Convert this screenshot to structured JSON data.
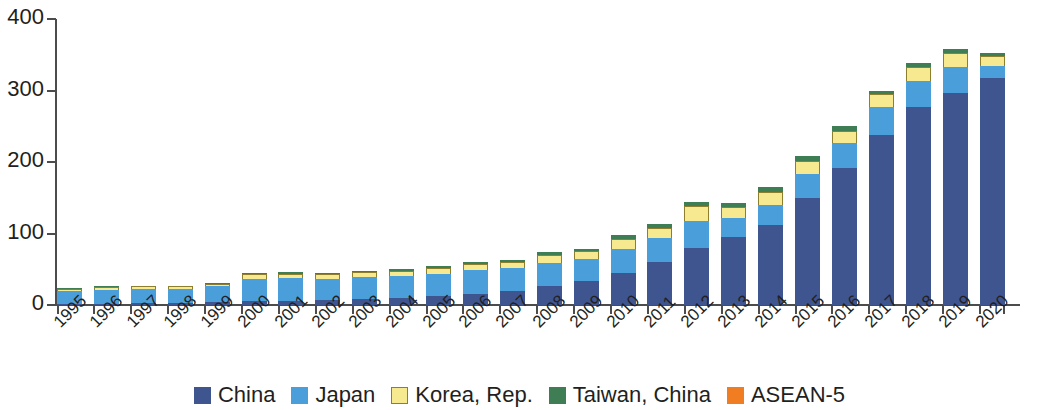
{
  "chart_data": {
    "type": "bar",
    "stacked": true,
    "title": "",
    "subtitle": "",
    "xlabel": "",
    "ylabel": "",
    "ylim": [
      0,
      400
    ],
    "yticks": [
      0,
      100,
      200,
      300,
      400
    ],
    "grid": false,
    "legend_position": "bottom",
    "categories": [
      "1995",
      "1996",
      "1997",
      "1998",
      "1999",
      "2000",
      "2001",
      "2002",
      "2003",
      "2004",
      "2005",
      "2006",
      "2007",
      "2008",
      "2009",
      "2010",
      "2011",
      "2012",
      "2013",
      "2014",
      "2015",
      "2016",
      "2017",
      "2018",
      "2019",
      "2020"
    ],
    "series": [
      {
        "name": "China",
        "color": "#3e5590",
        "values": [
          2,
          2,
          3,
          3,
          4,
          5,
          6,
          7,
          9,
          10,
          13,
          16,
          20,
          26,
          34,
          45,
          60,
          80,
          95,
          112,
          150,
          191,
          238,
          277,
          297,
          318
        ]
      },
      {
        "name": "Japan",
        "color": "#4a9ed9",
        "values": [
          18,
          19,
          19,
          19,
          22,
          32,
          32,
          30,
          30,
          30,
          31,
          33,
          32,
          33,
          31,
          34,
          34,
          38,
          27,
          28,
          33,
          35,
          39,
          37,
          36,
          16
        ]
      },
      {
        "name": "Korea, Rep.",
        "color": "#f6e990",
        "values": [
          3,
          4,
          4,
          4,
          4,
          6,
          6,
          6,
          7,
          7,
          8,
          8,
          8,
          11,
          10,
          14,
          14,
          20,
          15,
          18,
          19,
          18,
          18,
          19,
          19,
          14
        ]
      },
      {
        "name": "Taiwan, China",
        "color": "#3f7d55",
        "values": [
          1,
          1,
          1,
          1,
          1,
          2,
          2,
          2,
          2,
          3,
          3,
          3,
          3,
          4,
          4,
          5,
          5,
          6,
          6,
          7,
          7,
          6,
          5,
          5,
          6,
          5
        ]
      },
      {
        "name": "ASEAN-5",
        "color": "#f07d22",
        "values": [
          0,
          0,
          0,
          0,
          0,
          0,
          0,
          0,
          0,
          0,
          0,
          0,
          0,
          0,
          0,
          0,
          0,
          0,
          0,
          0,
          0,
          0,
          0,
          0,
          0,
          0
        ]
      }
    ],
    "totals": [
      24,
      26,
      27,
      27,
      31,
      45,
      46,
      45,
      48,
      50,
      55,
      60,
      63,
      74,
      79,
      98,
      113,
      144,
      143,
      165,
      209,
      250,
      300,
      338,
      358,
      353
    ]
  },
  "axis": {
    "y_tick_labels": [
      "400",
      "300",
      "200",
      "100",
      "0"
    ]
  },
  "legend": {
    "items": [
      {
        "label": "China",
        "swatch": "china-swatch"
      },
      {
        "label": "Japan",
        "swatch": "japan-swatch"
      },
      {
        "label": "Korea, Rep.",
        "swatch": "korea-swatch"
      },
      {
        "label": "Taiwan, China",
        "swatch": "taiwan-swatch"
      },
      {
        "label": "ASEAN-5",
        "swatch": "asean-swatch"
      }
    ]
  }
}
